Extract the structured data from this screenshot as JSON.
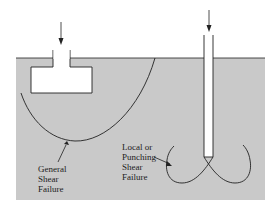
{
  "figure": {
    "colors": {
      "soil": "#c9c9c9",
      "line": "#222222",
      "background": "#ffffff"
    },
    "labels": {
      "general": [
        "General",
        "Shear",
        "Failure"
      ],
      "local": [
        "Local or",
        "Punching",
        "Shear",
        "Failure"
      ]
    },
    "elements": {
      "footing": "shallow-footing",
      "pile": "deep-pile",
      "load_arrows": 2
    }
  }
}
